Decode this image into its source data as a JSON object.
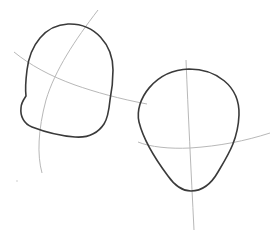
{
  "drawing": {
    "title": "Head shape construction sketch",
    "background": "#ffffff",
    "colors": {
      "outline": "#3a3a3a",
      "guide": "#b8b8b8"
    },
    "figures": [
      {
        "name": "left-head",
        "description": "Rounded boxy head outline, side view with jaw notch",
        "guides": [
          "vertical-curve",
          "horizontal-curve"
        ]
      },
      {
        "name": "right-head",
        "description": "Egg-shaped head outline, front view",
        "guides": [
          "vertical-line",
          "horizontal-curve"
        ]
      }
    ]
  }
}
